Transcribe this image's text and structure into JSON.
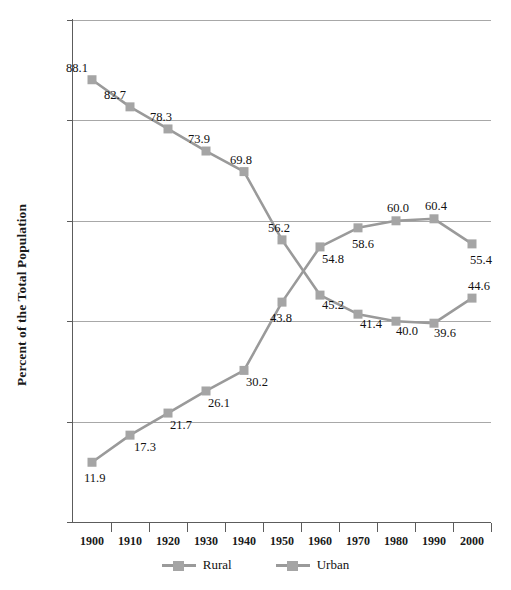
{
  "chart_data": {
    "type": "line",
    "title": "",
    "xlabel": "",
    "ylabel": "Percent of the Total Population",
    "categories": [
      "1900",
      "1910",
      "1920",
      "1930",
      "1940",
      "1950",
      "1960",
      "1970",
      "1980",
      "1990",
      "2000"
    ],
    "ylim": [
      0,
      100
    ],
    "y_ticks": [
      "0",
      "20",
      "40",
      "60",
      "80",
      "100"
    ],
    "grid": "horizontal",
    "legend_position": "bottom-center",
    "series": [
      {
        "name": "Rural",
        "values": [
          88.1,
          82.7,
          78.3,
          73.9,
          69.8,
          56.2,
          45.2,
          41.4,
          40.0,
          39.6,
          44.6
        ],
        "labels": [
          "88.1",
          "82.7",
          "78.3",
          "73.9",
          "69.8",
          "56.2",
          "45.2",
          "41.4",
          "40.0",
          "39.6",
          "44.6"
        ],
        "color": "#a5a5a5",
        "marker": "square"
      },
      {
        "name": "Urban",
        "values": [
          11.9,
          17.3,
          21.7,
          26.1,
          30.2,
          43.8,
          54.8,
          58.6,
          60.0,
          60.4,
          55.4
        ],
        "labels": [
          "11.9",
          "17.3",
          "21.7",
          "26.1",
          "30.2",
          "43.8",
          "54.8",
          "58.6",
          "60.0",
          "60.4",
          "55.4"
        ],
        "color": "#a5a5a5",
        "marker": "square"
      }
    ]
  },
  "axes": {
    "y_title": "Percent of the Total Population"
  },
  "legend": {
    "items": [
      {
        "label": "Rural"
      },
      {
        "label": "Urban"
      }
    ]
  },
  "colors": {
    "series": "#a5a5a5",
    "line": "#9a9a9a",
    "gridline": "#a8a8a8",
    "axis": "#5c5c5c",
    "text": "#111111",
    "background": "#ffffff"
  }
}
